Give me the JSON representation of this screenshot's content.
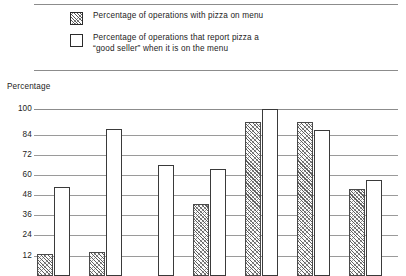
{
  "legend": {
    "items": [
      {
        "label": "Percentage of operations with pizza on menu",
        "pattern": "hatched"
      },
      {
        "label": "Percentage of operations that report pizza a\n“good seller” when it is on the menu",
        "pattern": "open"
      }
    ]
  },
  "axis": {
    "y_title": "Percentage"
  },
  "chart_data": {
    "type": "bar",
    "title": "",
    "xlabel": "",
    "ylabel": "Percentage",
    "ylim": [
      0,
      100
    ],
    "yticks": [
      100,
      84,
      72,
      60,
      48,
      36,
      24,
      12
    ],
    "grid": true,
    "legend_position": "top",
    "categories": [
      "1",
      "2",
      "3",
      "4",
      "5",
      "6",
      "7"
    ],
    "series": [
      {
        "name": "Percentage of operations with pizza on menu",
        "pattern": "hatched",
        "values": [
          13,
          14,
          0,
          43,
          92,
          92,
          52
        ]
      },
      {
        "name": "Percentage of operations that report pizza a “good seller” when it is on the menu",
        "pattern": "open",
        "values": [
          53,
          88,
          66,
          64,
          100,
          87,
          57
        ]
      }
    ]
  },
  "colors": {
    "rule": "#8c8c8c",
    "gridline": "#9a9a9a",
    "bar_outline": "#3a3a3a",
    "text": "#232323",
    "background": "#ffffff"
  }
}
